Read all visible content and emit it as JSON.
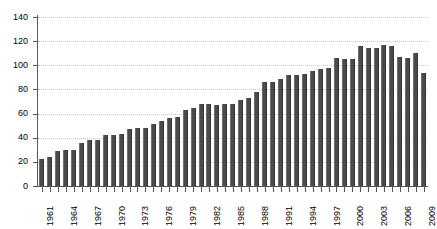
{
  "chart_data": {
    "type": "bar",
    "title": "",
    "subtitle": "",
    "xlabel": "",
    "ylabel": "",
    "ylim": [
      0,
      140
    ],
    "ytick_step": 20,
    "yticks": [
      0,
      20,
      40,
      60,
      80,
      100,
      120,
      140
    ],
    "grid": true,
    "grid_axis": "y",
    "grid_style": "dotted",
    "legend": false,
    "legend_position": "none",
    "bar_color": "#4a4a4a",
    "categories": [
      "1961",
      "1962",
      "1963",
      "1964",
      "1965",
      "1966",
      "1967",
      "1968",
      "1969",
      "1970",
      "1971",
      "1972",
      "1973",
      "1974",
      "1975",
      "1976",
      "1977",
      "1978",
      "1979",
      "1980",
      "1981",
      "1982",
      "1983",
      "1984",
      "1985",
      "1986",
      "1987",
      "1988",
      "1989",
      "1990",
      "1991",
      "1992",
      "1993",
      "1994",
      "1995",
      "1996",
      "1997",
      "1998",
      "1999",
      "2000",
      "2001",
      "2002",
      "2003",
      "2004",
      "2005",
      "2006",
      "2007",
      "2008",
      "2009"
    ],
    "values": [
      22,
      24,
      29,
      30,
      30,
      36,
      38,
      38,
      42,
      42,
      43,
      47,
      48,
      48,
      51,
      54,
      56,
      57,
      63,
      65,
      68,
      68,
      67,
      68,
      68,
      71,
      73,
      78,
      86,
      86,
      89,
      92,
      92,
      93,
      95,
      97,
      98,
      106,
      105,
      105,
      116,
      114,
      114,
      117,
      116,
      107,
      106,
      110,
      94
    ],
    "xtick_labels": [
      "1961",
      "1964",
      "1967",
      "1970",
      "1973",
      "1976",
      "1979",
      "1982",
      "1985",
      "1988",
      "1991",
      "1994",
      "1997",
      "2000",
      "2003",
      "2006",
      "2009"
    ],
    "xtick_indices": [
      0,
      3,
      6,
      9,
      12,
      15,
      18,
      21,
      24,
      27,
      30,
      33,
      36,
      39,
      42,
      45,
      48
    ]
  }
}
